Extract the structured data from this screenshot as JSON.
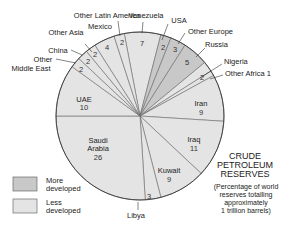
{
  "chart_data": {
    "type": "pie",
    "title": "CRUDE PETROLEUM RESERVES",
    "subtitle": "(Percentage of world reserves totalling approximately 1 trillion barrels)",
    "title_lines": [
      "CRUDE",
      "PETROLEUM",
      "RESERVES"
    ],
    "subtitle_lines": [
      "(Percentage of world",
      "reserves totalling",
      "approximately",
      "1 trillion barrels)"
    ],
    "start_angle_deg": -10.8,
    "direction": "clockwise",
    "slices": [
      {
        "label": "Venezuela",
        "value": 7,
        "group": "Less developed"
      },
      {
        "label": "USA",
        "value": 2,
        "group": "More developed"
      },
      {
        "label": "Other Europe",
        "value": 3,
        "group": "More developed"
      },
      {
        "label": "Russia",
        "value": 5,
        "group": "More developed"
      },
      {
        "label": "Nigeria",
        "value": 2,
        "group": "Less developed"
      },
      {
        "label": "Other Africa",
        "value": 1,
        "group": "Less developed"
      },
      {
        "label": "Iran",
        "value": 9,
        "group": "Less developed"
      },
      {
        "label": "Iraq",
        "value": 11,
        "group": "Less developed"
      },
      {
        "label": "Kuwait",
        "value": 9,
        "group": "Less developed"
      },
      {
        "label": "Libya",
        "value": 3,
        "group": "Less developed"
      },
      {
        "label": "Saudi Arabia",
        "value": 26,
        "group": "Less developed"
      },
      {
        "label": "UAE",
        "value": 10,
        "group": "Less developed"
      },
      {
        "label": "Other Middle East",
        "value": 2,
        "group": "Less developed"
      },
      {
        "label": "China",
        "value": 2,
        "group": "Less developed"
      },
      {
        "label": "Other Asia",
        "value": 2,
        "group": "Less developed"
      },
      {
        "label": "Mexico",
        "value": 4,
        "group": "Less developed"
      },
      {
        "label": "Other Latin America",
        "value": 2,
        "group": "Less developed"
      }
    ],
    "legend": [
      {
        "label": "More developed",
        "lines": [
          "More",
          "developed"
        ],
        "color": "#c8c8c8"
      },
      {
        "label": "Less developed",
        "lines": [
          "Less",
          "developed"
        ],
        "color": "#e4e4e4"
      }
    ],
    "colors": {
      "More developed": "#c8c8c8",
      "Less developed": "#e4e4e4",
      "stroke": "#555555"
    }
  },
  "labels": {
    "venezuela": "Venezuela",
    "venezuela_v": "7",
    "usa": "USA",
    "usa_v": "2",
    "other_europe": "Other Europe",
    "other_europe_v": "3",
    "russia": "Russia",
    "russia_v": "5",
    "nigeria": "Nigeria",
    "nigeria_v": "2",
    "other_africa": "Other Africa 1",
    "iran": "Iran",
    "iran_v": "9",
    "iraq": "Iraq",
    "iraq_v": "11",
    "kuwait": "Kuwait",
    "kuwait_v": "9",
    "libya": "Libya",
    "libya_v": "3",
    "saudi_1": "Saudi",
    "saudi_2": "Arabia",
    "saudi_v": "26",
    "uae": "UAE",
    "uae_v": "10",
    "other_me_1": "Other",
    "other_me_2": "Middle East",
    "other_me_v": "2",
    "china": "China",
    "china_v": "2",
    "other_asia": "Other Asia",
    "other_asia_v": "2",
    "mexico": "Mexico",
    "mexico_v": "4",
    "other_latam": "Other Latin America",
    "other_latam_v": "2"
  }
}
